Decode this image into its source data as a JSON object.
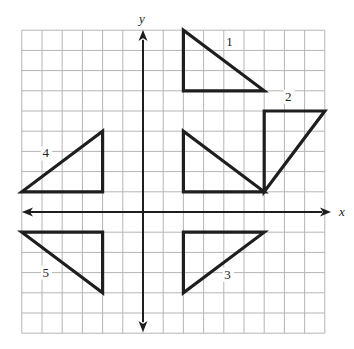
{
  "diagram": {
    "type": "coordinate-grid",
    "grid": {
      "x_min": -6,
      "x_max": 9,
      "y_min": -6,
      "y_max": 9,
      "cell_px": 20.2,
      "origin_px": [
        143,
        212
      ],
      "left_px": 21,
      "top_px": 29
    },
    "axes": {
      "x_label": "x",
      "y_label": "y"
    },
    "colors": {
      "grid": "#b5b5b5",
      "ink": "#1e1e1e"
    },
    "triangles": [
      {
        "label": "1",
        "vertices": [
          [
            2,
            9
          ],
          [
            2,
            6
          ],
          [
            6,
            6
          ]
        ],
        "label_pos": [
          4.3,
          8.2
        ]
      },
      {
        "label": "2",
        "vertices": [
          [
            6,
            1
          ],
          [
            6,
            5
          ],
          [
            9,
            5
          ]
        ],
        "label_pos": [
          7.2,
          5.5
        ]
      },
      {
        "label": "",
        "vertices": [
          [
            2,
            4
          ],
          [
            2,
            1
          ],
          [
            6,
            1
          ]
        ],
        "label_pos": null
      },
      {
        "label": "4",
        "vertices": [
          [
            -6,
            1
          ],
          [
            -2,
            1
          ],
          [
            -2,
            4
          ]
        ],
        "label_pos": [
          -4.8,
          2.7
        ]
      },
      {
        "label": "5",
        "vertices": [
          [
            -6,
            -1
          ],
          [
            -2,
            -1
          ],
          [
            -2,
            -4
          ]
        ],
        "label_pos": [
          -4.8,
          -3.2
        ]
      },
      {
        "label": "3",
        "vertices": [
          [
            2,
            -1
          ],
          [
            6,
            -1
          ],
          [
            2,
            -4
          ]
        ],
        "label_pos": [
          4.2,
          -3.3
        ]
      }
    ]
  }
}
